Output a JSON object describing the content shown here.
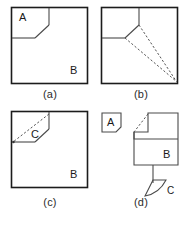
{
  "figure": {
    "type": "technical-line-diagram",
    "panel_count": 4,
    "background_color": "#ffffff",
    "line_color": "#1c1c1c",
    "dashed_line_color": "#555555",
    "panels": [
      {
        "id": "a",
        "caption": "(a)",
        "labels": [
          {
            "text": "A",
            "role": "corner-region-label"
          },
          {
            "text": "B",
            "role": "main-region-label"
          }
        ],
        "shape": "square with top-left sub-rectangle whose inner corner is chamfered",
        "dashed_lines": 0
      },
      {
        "id": "b",
        "caption": "(b)",
        "labels": [],
        "shape": "square with chamfered top-left notch and two dashed rays converging at the bottom-right corner",
        "dashed_lines": 2
      },
      {
        "id": "c",
        "caption": "(c)",
        "labels": [
          {
            "text": "C",
            "role": "chamfer-region-label"
          },
          {
            "text": "B",
            "role": "main-region-label"
          }
        ],
        "shape": "square with top-left notch, dashed diagonal across the notch enclosing region C",
        "dashed_lines": 1
      },
      {
        "id": "d",
        "caption": "(d)",
        "labels": [
          {
            "text": "A",
            "role": "separated-piece-label"
          },
          {
            "text": "B",
            "role": "main-region-label"
          },
          {
            "text": "C",
            "role": "separated-sliver-label"
          }
        ],
        "shape": "exploded view: small square piece A at left, notched square B at right, thin curved sliver C pulled out below B with a leader line",
        "dashed_lines": 1
      }
    ]
  }
}
